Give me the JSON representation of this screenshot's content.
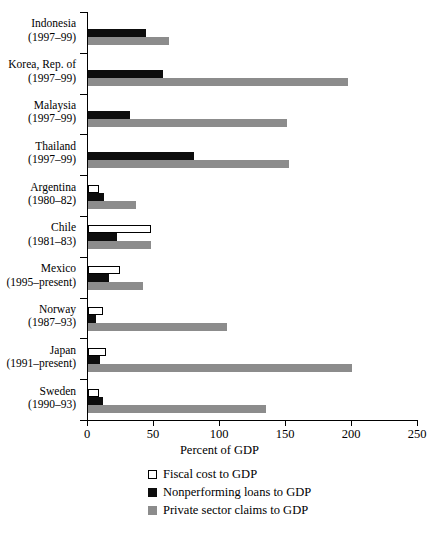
{
  "chart_data": {
    "type": "bar",
    "orientation": "horizontal",
    "title": "",
    "xlabel": "Percent of GDP",
    "ylabel": "",
    "xlim": [
      0,
      250
    ],
    "xticks": [
      0,
      50,
      100,
      150,
      200,
      250
    ],
    "grid": false,
    "legend_position": "bottom",
    "categories": [
      "Indonesia (1997–99)",
      "Korea, Rep. of (1997–99)",
      "Malaysia (1997–99)",
      "Thailand (1997–99)",
      "Argentina (1980–82)",
      "Chile (1981–83)",
      "Mexico (1995–present)",
      "Norway (1987–93)",
      "Japan (1991–present)",
      "Sweden (1990–93)"
    ],
    "series": [
      {
        "name": "Fiscal cost to GDP",
        "color": "#ffffff",
        "values": [
          0,
          0,
          0,
          0,
          8,
          48,
          24,
          11,
          14,
          8
        ]
      },
      {
        "name": "Nonperforming loans to GDP",
        "color": "#0d0d0d",
        "values": [
          44,
          57,
          32,
          80,
          12,
          22,
          16,
          6,
          9,
          11
        ]
      },
      {
        "name": "Private sector claims to GDP",
        "color": "#8c8c8c",
        "values": [
          61,
          197,
          151,
          152,
          36,
          48,
          42,
          105,
          200,
          135
        ]
      }
    ]
  },
  "axis": {
    "x_title": "Percent of GDP",
    "tick_labels": [
      "0",
      "50",
      "100",
      "150",
      "200",
      "250"
    ]
  },
  "groups": [
    {
      "country": "Indonesia",
      "period": "(1997–99)",
      "fiscal": 0,
      "npl": 44,
      "claims": 61
    },
    {
      "country": "Korea, Rep. of",
      "period": "(1997–99)",
      "fiscal": 0,
      "npl": 57,
      "claims": 197
    },
    {
      "country": "Malaysia",
      "period": "(1997–99)",
      "fiscal": 0,
      "npl": 32,
      "claims": 151
    },
    {
      "country": "Thailand",
      "period": "(1997–99)",
      "fiscal": 0,
      "npl": 80,
      "claims": 152
    },
    {
      "country": "Argentina",
      "period": "(1980–82)",
      "fiscal": 8,
      "npl": 12,
      "claims": 36
    },
    {
      "country": "Chile",
      "period": "(1981–83)",
      "fiscal": 48,
      "npl": 22,
      "claims": 48
    },
    {
      "country": "Mexico",
      "period": "(1995–present)",
      "fiscal": 24,
      "npl": 16,
      "claims": 42
    },
    {
      "country": "Norway",
      "period": "(1987–93)",
      "fiscal": 11,
      "npl": 6,
      "claims": 105
    },
    {
      "country": "Japan",
      "period": "(1991–present)",
      "fiscal": 14,
      "npl": 9,
      "claims": 200
    },
    {
      "country": "Sweden",
      "period": "(1990–93)",
      "fiscal": 8,
      "npl": 11,
      "claims": 135
    }
  ],
  "legend": {
    "items": [
      {
        "label": "Fiscal cost to GDP",
        "swatch": "sw-fiscal"
      },
      {
        "label": "Nonperforming loans to GDP",
        "swatch": "sw-npl"
      },
      {
        "label": "Private sector claims to GDP",
        "swatch": "sw-claims"
      }
    ]
  },
  "footnote": {
    "text": ""
  },
  "colors": {
    "fiscal": "#ffffff",
    "npl": "#0d0d0d",
    "claims": "#8c8c8c",
    "axis": "#000000"
  }
}
